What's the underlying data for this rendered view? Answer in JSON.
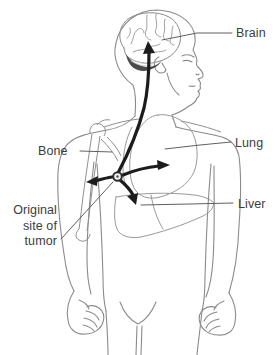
{
  "labels": {
    "brain": "Brain",
    "lung": "Lung",
    "bone": "Bone",
    "liver": "Liver",
    "original_site": {
      "line1": "Original",
      "line2": "site of",
      "line3": "tumor"
    }
  },
  "colors": {
    "background": "#ffffff",
    "figure_outline": "#8b8b8b",
    "skeleton_line": "#8f8f8f",
    "organ_line": "#999999",
    "brain_line": "#8a8a8a",
    "cerebellum_fill": "#4a4a4a",
    "cerebellum_highlight": "#c9c9c9",
    "arrow": "#1c1c1c",
    "tumor_ring": "#2e2e2e",
    "tumor_center": "#f2f2f2",
    "tumor_dot": "#555555",
    "leader_line": "#606060",
    "label_text": "#3c3c3c"
  }
}
